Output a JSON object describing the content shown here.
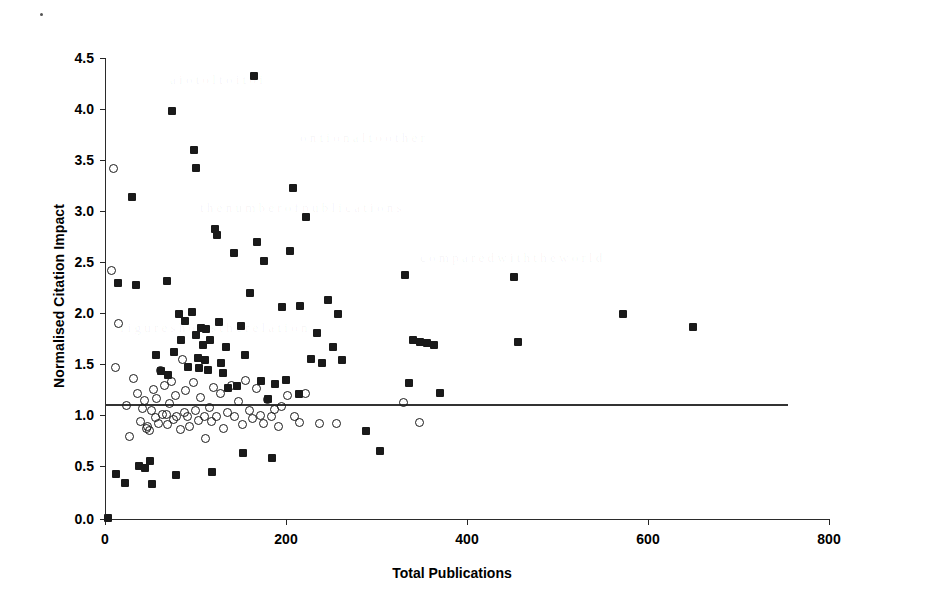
{
  "chart_data": {
    "type": "scatter",
    "title": "",
    "xlabel": "Total Publications",
    "ylabel": "Normalised Citation Impact",
    "xlim": [
      0,
      800
    ],
    "ylim": [
      0.0,
      4.5
    ],
    "xticks": [
      0,
      200,
      400,
      600,
      800
    ],
    "xtick_labels": [
      "0",
      "200",
      "400",
      "600",
      "800"
    ],
    "yticks": [
      0.0,
      0.5,
      1.0,
      1.5,
      2.0,
      2.5,
      3.0,
      3.5,
      4.0,
      4.5
    ],
    "ytick_labels": [
      "0.0",
      "0.5",
      "1.0",
      "1.5",
      "2.0",
      "2.5",
      "3.0",
      "3.5",
      "4.0",
      "4.5"
    ],
    "grid": false,
    "legend": null,
    "reference_line": {
      "orientation": "horizontal",
      "y": 1.0,
      "x_start": 0,
      "x_end": 700,
      "label": "world average = 1.0"
    },
    "series": [
      {
        "name": "filled-squares",
        "marker": "filled-square",
        "color": "#1a1a1a",
        "points": [
          [
            3,
            0.01
          ],
          [
            12,
            0.44
          ],
          [
            14,
            2.3
          ],
          [
            22,
            0.35
          ],
          [
            30,
            3.14
          ],
          [
            34,
            2.28
          ],
          [
            38,
            0.52
          ],
          [
            44,
            0.5
          ],
          [
            50,
            0.57
          ],
          [
            52,
            0.34
          ],
          [
            56,
            1.6
          ],
          [
            62,
            1.44
          ],
          [
            68,
            2.32
          ],
          [
            70,
            1.41
          ],
          [
            74,
            3.98
          ],
          [
            76,
            1.63
          ],
          [
            78,
            0.43
          ],
          [
            82,
            2.0
          ],
          [
            84,
            1.75
          ],
          [
            88,
            1.93
          ],
          [
            92,
            1.48
          ],
          [
            96,
            2.02
          ],
          [
            98,
            3.6
          ],
          [
            100,
            3.43
          ],
          [
            101,
            1.8
          ],
          [
            103,
            1.57
          ],
          [
            104,
            1.47
          ],
          [
            106,
            1.86
          ],
          [
            108,
            1.7
          ],
          [
            110,
            1.55
          ],
          [
            112,
            1.85
          ],
          [
            114,
            1.45
          ],
          [
            116,
            1.75
          ],
          [
            118,
            0.46
          ],
          [
            122,
            2.83
          ],
          [
            124,
            2.77
          ],
          [
            126,
            1.92
          ],
          [
            128,
            1.52
          ],
          [
            130,
            1.43
          ],
          [
            134,
            1.68
          ],
          [
            136,
            1.28
          ],
          [
            142,
            2.6
          ],
          [
            146,
            1.3
          ],
          [
            150,
            1.88
          ],
          [
            152,
            0.64
          ],
          [
            155,
            1.6
          ],
          [
            160,
            2.21
          ],
          [
            165,
            4.32
          ],
          [
            168,
            2.7
          ],
          [
            172,
            1.35
          ],
          [
            176,
            2.52
          ],
          [
            180,
            1.17
          ],
          [
            184,
            0.6
          ],
          [
            188,
            1.32
          ],
          [
            196,
            2.07
          ],
          [
            200,
            1.36
          ],
          [
            204,
            2.62
          ],
          [
            208,
            3.23
          ],
          [
            214,
            1.22
          ],
          [
            216,
            2.08
          ],
          [
            222,
            2.95
          ],
          [
            228,
            1.56
          ],
          [
            234,
            1.82
          ],
          [
            240,
            1.52
          ],
          [
            246,
            2.14
          ],
          [
            252,
            1.68
          ],
          [
            258,
            2.0
          ],
          [
            262,
            1.55
          ],
          [
            288,
            0.86
          ],
          [
            304,
            0.66
          ],
          [
            332,
            2.38
          ],
          [
            336,
            1.33
          ],
          [
            340,
            1.75
          ],
          [
            348,
            1.73
          ],
          [
            356,
            1.72
          ],
          [
            364,
            1.7
          ],
          [
            370,
            1.23
          ],
          [
            452,
            2.36
          ],
          [
            456,
            1.73
          ],
          [
            572,
            2.0
          ],
          [
            650,
            1.87
          ]
        ]
      },
      {
        "name": "open-circles",
        "marker": "open-circle",
        "color": "#1a1a1a",
        "points": [
          [
            8,
            2.42
          ],
          [
            10,
            3.42
          ],
          [
            12,
            1.47
          ],
          [
            16,
            1.9
          ],
          [
            24,
            1.1
          ],
          [
            28,
            0.8
          ],
          [
            32,
            1.37
          ],
          [
            36,
            1.22
          ],
          [
            40,
            0.95
          ],
          [
            42,
            1.07
          ],
          [
            44,
            1.15
          ],
          [
            46,
            0.88
          ],
          [
            48,
            0.9
          ],
          [
            50,
            0.86
          ],
          [
            52,
            1.05
          ],
          [
            54,
            1.26
          ],
          [
            56,
            0.99
          ],
          [
            58,
            1.17
          ],
          [
            60,
            0.93
          ],
          [
            62,
            1.44
          ],
          [
            64,
            1.02
          ],
          [
            66,
            1.3
          ],
          [
            68,
            1.02
          ],
          [
            70,
            0.92
          ],
          [
            72,
            1.12
          ],
          [
            74,
            1.34
          ],
          [
            76,
            0.97
          ],
          [
            78,
            1.2
          ],
          [
            80,
            1.0
          ],
          [
            84,
            0.87
          ],
          [
            86,
            1.55
          ],
          [
            88,
            1.03
          ],
          [
            90,
            1.25
          ],
          [
            92,
            1.0
          ],
          [
            94,
            0.9
          ],
          [
            98,
            1.33
          ],
          [
            100,
            1.05
          ],
          [
            104,
            0.96
          ],
          [
            106,
            1.18
          ],
          [
            110,
            1.0
          ],
          [
            112,
            0.78
          ],
          [
            116,
            1.08
          ],
          [
            118,
            0.95
          ],
          [
            120,
            1.28
          ],
          [
            124,
            1.0
          ],
          [
            128,
            1.22
          ],
          [
            132,
            0.88
          ],
          [
            136,
            1.03
          ],
          [
            140,
            1.3
          ],
          [
            144,
            1.0
          ],
          [
            148,
            1.14
          ],
          [
            152,
            0.92
          ],
          [
            156,
            1.35
          ],
          [
            160,
            1.05
          ],
          [
            164,
            0.98
          ],
          [
            168,
            1.27
          ],
          [
            172,
            1.01
          ],
          [
            176,
            0.93
          ],
          [
            180,
            1.16
          ],
          [
            184,
            1.0
          ],
          [
            188,
            1.06
          ],
          [
            192,
            0.9
          ],
          [
            196,
            1.09
          ],
          [
            202,
            1.2
          ],
          [
            210,
            1.0
          ],
          [
            216,
            0.94
          ],
          [
            222,
            1.22
          ],
          [
            238,
            0.93
          ],
          [
            256,
            0.93
          ],
          [
            330,
            1.13
          ],
          [
            348,
            0.94
          ]
        ]
      }
    ]
  },
  "axes": {
    "y_title": "Normalised Citation Impact",
    "x_title": "Total Publications"
  }
}
